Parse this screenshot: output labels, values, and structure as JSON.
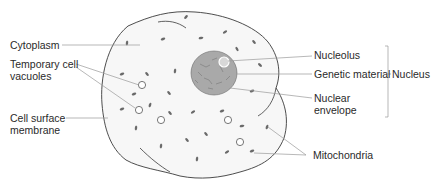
{
  "diagram": {
    "colors": {
      "cell_outline": "#3a3a3a",
      "cell_fill": "#f7f7f7",
      "nucleus_fill": "#a9a9a9",
      "leader_line": "#9a9a9a",
      "text": "#2a2a2a"
    },
    "labels_left": [
      {
        "id": "cytoplasm",
        "lines": [
          "Cytoplasm"
        ]
      },
      {
        "id": "temporary-cell-vacuoles",
        "lines": [
          "Temporary cell",
          "vacuoles"
        ]
      },
      {
        "id": "cell-surface-membrane",
        "lines": [
          "Cell surface",
          "membrane"
        ]
      }
    ],
    "labels_right": [
      {
        "id": "nucleolus",
        "lines": [
          "Nucleolus"
        ]
      },
      {
        "id": "genetic-material",
        "lines": [
          "Genetic material"
        ]
      },
      {
        "id": "nuclear-envelope",
        "lines": [
          "Nuclear",
          "envelope"
        ]
      },
      {
        "id": "mitochondria",
        "lines": [
          "Mitochondria"
        ]
      }
    ],
    "group_label": {
      "id": "nucleus",
      "text": "Nucleus",
      "groups": [
        "Nucleolus",
        "Genetic material",
        "Nuclear envelope"
      ]
    }
  }
}
